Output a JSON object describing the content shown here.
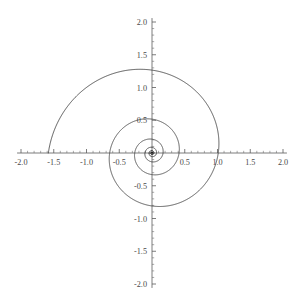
{
  "figure": {
    "width": 299,
    "height": 307,
    "background_color": "#ffffff",
    "origin_px": {
      "x": 152,
      "y": 153
    },
    "scale_px_per_unit": 65.5
  },
  "chart_data": {
    "type": "line",
    "title": "",
    "subtitle": "",
    "xlabel": "",
    "ylabel": "",
    "grid": false,
    "legend": false,
    "legend_position": "none",
    "xlim": [
      -2.0,
      2.0
    ],
    "ylim": [
      -2.0,
      2.0
    ],
    "xticks": [
      -2.0,
      -1.5,
      -1.0,
      -0.5,
      0.5,
      1.0,
      1.5,
      2.0
    ],
    "yticks": [
      -2.0,
      -1.5,
      -1.0,
      -0.5,
      0.5,
      1.0,
      1.5,
      2.0
    ],
    "xtick_labels": [
      "-2.0",
      "-1.5",
      "-1.0",
      "-0.5",
      "0.5",
      "1.0",
      "1.5",
      "2.0"
    ],
    "ytick_labels": [
      "-2.0",
      "-1.5",
      "-1.0",
      "-0.5",
      "0.5",
      "1.0",
      "1.5",
      "2.0"
    ],
    "minor_ticks_per_interval": 5,
    "axis_color": "#5a5a5a",
    "curve_color": "#3c3c3c",
    "curve_width": 0.85,
    "series": [
      {
        "name": "r = a*exp(b*theta)",
        "kind": "polar-spiral",
        "a": 0.0115,
        "b": 0.1425,
        "theta_start_deg": -40,
        "theta_end_deg": 1980,
        "turns": 5.6,
        "growth_ratio_per_half_turn": 1.56,
        "axis_crossings_positive_x": [
          0.045,
          0.11,
          0.27,
          0.45,
          0.73,
          1.0,
          1.53
        ],
        "axis_crossings_negative_x": [
          -0.07,
          -0.17,
          -0.35,
          -0.57,
          -0.95,
          -1.2,
          -1.95
        ],
        "axis_crossings_positive_y": [
          0.06,
          0.14,
          0.27,
          0.43,
          0.72,
          1.12,
          1.75
        ],
        "axis_crossings_negative_y": [
          -0.05,
          -0.13,
          -0.22,
          -0.34,
          -0.55,
          -0.88,
          -1.4
        ],
        "endpoint": {
          "x": -0.62,
          "y": -2.09
        }
      }
    ]
  }
}
